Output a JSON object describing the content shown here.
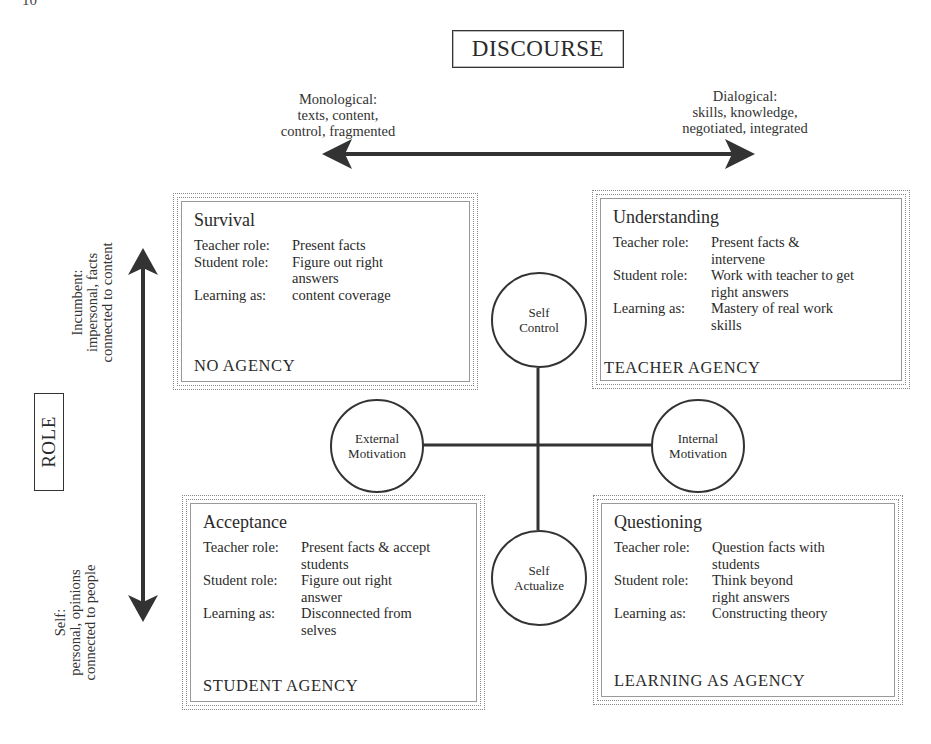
{
  "page": {
    "number": "10"
  },
  "diagram": {
    "title": "DISCOURSE",
    "horizontal_axis": {
      "left_pole": {
        "line1": "Monological:",
        "line2": "texts, content,",
        "line3": "control, fragmented"
      },
      "right_pole": {
        "line1": "Dialogical:",
        "line2": "skills, knowledge,",
        "line3": "negotiated, integrated"
      }
    },
    "vertical_axis": {
      "label": "ROLE",
      "top_pole": {
        "line1": "Incumbent:",
        "line2": "impersonal, facts",
        "line3": "connected to content"
      },
      "bottom_pole": {
        "line1": "Self:",
        "line2": "personal, opinions",
        "line3": "connected to people"
      }
    },
    "quadrants": [
      {
        "title": "Survival",
        "rows": [
          {
            "key": "Teacher role:",
            "value": "Present facts"
          },
          {
            "key": "Student role:",
            "value": "Figure out right answers"
          },
          {
            "key": "Learning as:",
            "value": "content coverage"
          }
        ],
        "agency": "NO AGENCY"
      },
      {
        "title": "Understanding",
        "rows": [
          {
            "key": "Teacher role:",
            "value": "Present facts & intervene"
          },
          {
            "key": "Student role:",
            "value": "Work with teacher to get right answers"
          },
          {
            "key": "Learning as:",
            "value": "Mastery of real work skills"
          }
        ],
        "agency": "TEACHER AGENCY"
      },
      {
        "title": "Acceptance",
        "rows": [
          {
            "key": "Teacher role:",
            "value": "Present facts & accept students"
          },
          {
            "key": "Student role:",
            "value": "Figure out right answer"
          },
          {
            "key": "Learning as:",
            "value": "Disconnected from selves"
          }
        ],
        "agency": "STUDENT AGENCY"
      },
      {
        "title": "Questioning",
        "rows": [
          {
            "key": "Teacher role:",
            "value": "Question facts with students"
          },
          {
            "key": "Student role:",
            "value": "Think beyond right answers"
          },
          {
            "key": "Learning as:",
            "value": "Constructing theory"
          }
        ],
        "agency": "LEARNING AS AGENCY"
      }
    ],
    "center_nodes": {
      "top": {
        "line1": "Self",
        "line2": "Control"
      },
      "bottom": {
        "line1": "Self",
        "line2": "Actualize"
      },
      "left": {
        "line1": "External",
        "line2": "Motivation"
      },
      "right": {
        "line1": "Internal",
        "line2": "Motivation"
      }
    },
    "colors": {
      "ink": "#2a2a2a",
      "background": "#ffffff",
      "border_dotted": "#888888"
    }
  }
}
